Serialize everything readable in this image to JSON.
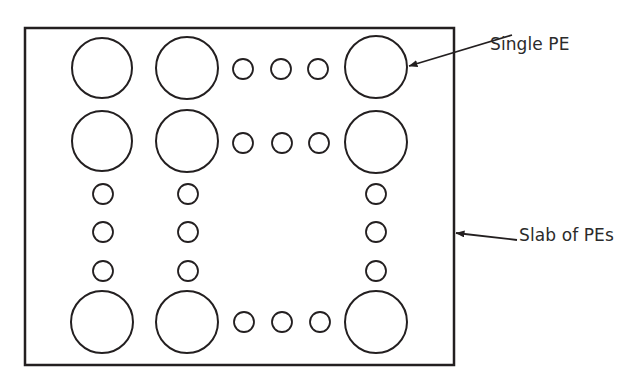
{
  "figure": {
    "kind": "schematic-diagram",
    "background_color": "#ffffff",
    "stroke_color": "#231f20",
    "text_color": "#2b2b2b"
  },
  "slab": {
    "name": "Slab of PEs",
    "shape": "rectangle",
    "x": 25,
    "y": 28,
    "width": 429,
    "height": 337,
    "stroke_width": 2.5
  },
  "annotations": [
    {
      "id": "single-pe",
      "label": "Single PE",
      "text_x": 490,
      "text_y": 36,
      "arrow": {
        "x1": 512,
        "y1": 35,
        "x2": 409,
        "y2": 66
      }
    },
    {
      "id": "slab-of-pes",
      "label": "Slab of PEs",
      "text_x": 519,
      "text_y": 227,
      "arrow": {
        "x1": 517,
        "y1": 240,
        "x2": 456,
        "y2": 233
      }
    }
  ],
  "pe_elements": [
    {
      "id": "pe-r1-c1",
      "row": 1,
      "col": 1,
      "size": "large",
      "cx": 102,
      "cy": 68,
      "r": 30
    },
    {
      "id": "pe-r1-c2",
      "row": 1,
      "col": 2,
      "size": "large",
      "cx": 187,
      "cy": 68,
      "r": 31
    },
    {
      "id": "pe-r1-e1",
      "row": 1,
      "col": 3,
      "size": "small",
      "cx": 243,
      "cy": 69,
      "r": 10
    },
    {
      "id": "pe-r1-e2",
      "row": 1,
      "col": 4,
      "size": "small",
      "cx": 281,
      "cy": 69,
      "r": 10
    },
    {
      "id": "pe-r1-e3",
      "row": 1,
      "col": 5,
      "size": "small",
      "cx": 318,
      "cy": 69,
      "r": 10
    },
    {
      "id": "pe-r1-c6",
      "row": 1,
      "col": 6,
      "size": "large",
      "cx": 376,
      "cy": 67,
      "r": 31
    },
    {
      "id": "pe-r2-c1",
      "row": 2,
      "col": 1,
      "size": "large",
      "cx": 102,
      "cy": 141,
      "r": 30
    },
    {
      "id": "pe-r2-c2",
      "row": 2,
      "col": 2,
      "size": "large",
      "cx": 187,
      "cy": 141,
      "r": 31
    },
    {
      "id": "pe-r2-e1",
      "row": 2,
      "col": 3,
      "size": "small",
      "cx": 243,
      "cy": 143,
      "r": 10
    },
    {
      "id": "pe-r2-e2",
      "row": 2,
      "col": 4,
      "size": "small",
      "cx": 282,
      "cy": 143,
      "r": 10
    },
    {
      "id": "pe-r2-e3",
      "row": 2,
      "col": 5,
      "size": "small",
      "cx": 319,
      "cy": 143,
      "r": 10
    },
    {
      "id": "pe-r2-c6",
      "row": 2,
      "col": 6,
      "size": "large",
      "cx": 376,
      "cy": 142,
      "r": 31
    },
    {
      "id": "pe-r3-c1",
      "row": 3,
      "col": 1,
      "size": "small",
      "cx": 103,
      "cy": 194,
      "r": 10
    },
    {
      "id": "pe-r3-c2",
      "row": 3,
      "col": 2,
      "size": "small",
      "cx": 188,
      "cy": 194,
      "r": 10
    },
    {
      "id": "pe-r3-c6",
      "row": 3,
      "col": 6,
      "size": "small",
      "cx": 376,
      "cy": 194,
      "r": 10
    },
    {
      "id": "pe-r4-c1",
      "row": 4,
      "col": 1,
      "size": "small",
      "cx": 103,
      "cy": 232,
      "r": 10
    },
    {
      "id": "pe-r4-c2",
      "row": 4,
      "col": 2,
      "size": "small",
      "cx": 188,
      "cy": 232,
      "r": 10
    },
    {
      "id": "pe-r4-c6",
      "row": 4,
      "col": 6,
      "size": "small",
      "cx": 376,
      "cy": 232,
      "r": 10
    },
    {
      "id": "pe-r5-c1",
      "row": 5,
      "col": 1,
      "size": "small",
      "cx": 103,
      "cy": 271,
      "r": 10
    },
    {
      "id": "pe-r5-c2",
      "row": 5,
      "col": 2,
      "size": "small",
      "cx": 188,
      "cy": 271,
      "r": 10
    },
    {
      "id": "pe-r5-c6",
      "row": 5,
      "col": 6,
      "size": "small",
      "cx": 376,
      "cy": 271,
      "r": 10
    },
    {
      "id": "pe-r6-c1",
      "row": 6,
      "col": 1,
      "size": "large",
      "cx": 102,
      "cy": 322,
      "r": 31
    },
    {
      "id": "pe-r6-c2",
      "row": 6,
      "col": 2,
      "size": "large",
      "cx": 187,
      "cy": 322,
      "r": 31
    },
    {
      "id": "pe-r6-e1",
      "row": 6,
      "col": 3,
      "size": "small",
      "cx": 244,
      "cy": 322,
      "r": 10
    },
    {
      "id": "pe-r6-e2",
      "row": 6,
      "col": 4,
      "size": "small",
      "cx": 282,
      "cy": 322,
      "r": 10
    },
    {
      "id": "pe-r6-e3",
      "row": 6,
      "col": 5,
      "size": "small",
      "cx": 320,
      "cy": 322,
      "r": 10
    },
    {
      "id": "pe-r6-c6",
      "row": 6,
      "col": 6,
      "size": "large",
      "cx": 376,
      "cy": 322,
      "r": 31
    }
  ]
}
